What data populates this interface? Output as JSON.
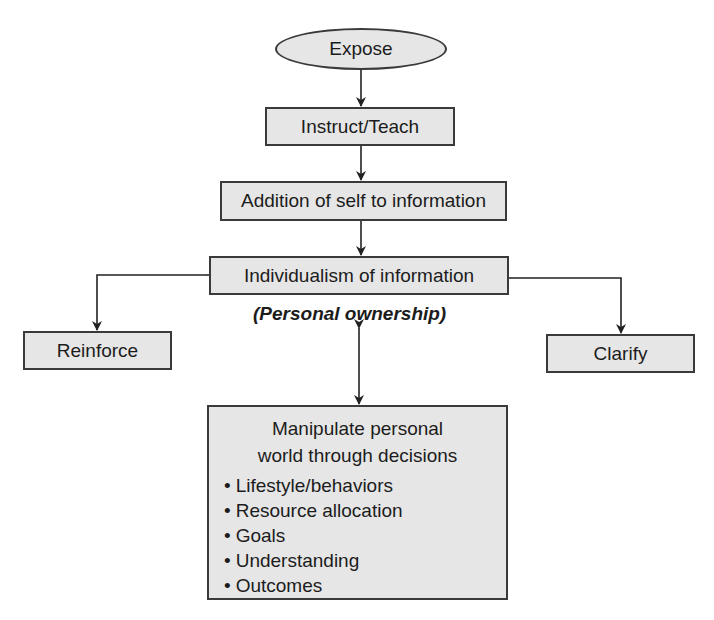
{
  "diagram": {
    "nodes": {
      "expose": "Expose",
      "instruct": "Instruct/Teach",
      "addition": "Addition of self to information",
      "individualism": "Individualism of information",
      "ownership_note": "(Personal ownership)",
      "reinforce": "Reinforce",
      "clarify": "Clarify",
      "manipulate": {
        "title_line1": "Manipulate personal",
        "title_line2": "world through decisions",
        "items": [
          "Lifestyle/behaviors",
          "Resource allocation",
          "Goals",
          "Understanding",
          "Outcomes"
        ]
      }
    },
    "edges": [
      {
        "from": "Expose",
        "to": "Instruct/Teach",
        "type": "arrow"
      },
      {
        "from": "Instruct/Teach",
        "to": "Addition of self to information",
        "type": "arrow"
      },
      {
        "from": "Addition of self to information",
        "to": "Individualism of information",
        "type": "arrow"
      },
      {
        "from": "Individualism of information",
        "to": "Reinforce",
        "type": "bidirectional"
      },
      {
        "from": "Individualism of information",
        "to": "Clarify",
        "type": "bidirectional"
      },
      {
        "from": "Individualism of information",
        "to": "Manipulate personal world through decisions",
        "type": "bidirectional"
      }
    ],
    "colors": {
      "box_fill": "#e6e6e6",
      "stroke": "#3a3a3a"
    }
  }
}
